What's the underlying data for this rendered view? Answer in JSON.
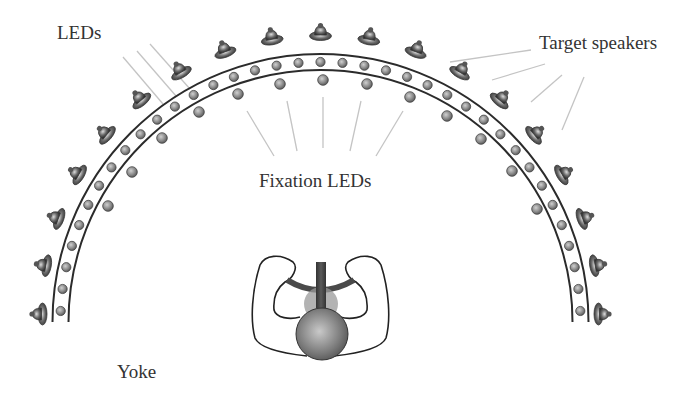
{
  "labels": {
    "leds": "LEDs",
    "target_speakers": "Target speakers",
    "fixation_leds": "Fixation LEDs",
    "yoke": "Yoke"
  },
  "colors": {
    "rail": "#2b2b2b",
    "pointer_line": "#c4c4c4",
    "led_fill_light": "#c8c8c8",
    "led_fill_dark": "#6a6a6a",
    "speaker_dark": "#3a3a3a",
    "speaker_light": "#d6d6d6",
    "text": "#333333"
  },
  "geometry": {
    "center": [
      320.5,
      322
    ],
    "outer_rail_radius": 268,
    "inner_rail_radius": 252,
    "led_radius": 260,
    "led_count": 37,
    "speaker_radius": 281,
    "speaker_count": 19,
    "fixation_points": [
      [
        108,
        206
      ],
      [
        132,
        172
      ],
      [
        162,
        138
      ],
      [
        199,
        112
      ],
      [
        238,
        94
      ],
      [
        280,
        84
      ],
      [
        323,
        80
      ],
      [
        367,
        84
      ],
      [
        410,
        97
      ],
      [
        447,
        116
      ],
      [
        481,
        139
      ],
      [
        512,
        171
      ],
      [
        537,
        209
      ]
    ]
  },
  "pointer_lines": {
    "leds": [
      [
        123,
        57,
        163,
        104
      ],
      [
        137,
        51,
        176,
        96
      ],
      [
        150,
        44,
        190,
        89
      ]
    ],
    "target_speakers": [
      [
        531,
        50,
        450,
        62
      ],
      [
        545,
        64,
        492,
        80
      ],
      [
        562,
        75,
        531,
        102
      ],
      [
        584,
        77,
        562,
        130
      ]
    ],
    "fixation_leds": [
      [
        247,
        111,
        274,
        156
      ],
      [
        287,
        101,
        297,
        151
      ],
      [
        323,
        97,
        323,
        148
      ],
      [
        361,
        101,
        350,
        151
      ],
      [
        403,
        111,
        376,
        156
      ]
    ]
  }
}
